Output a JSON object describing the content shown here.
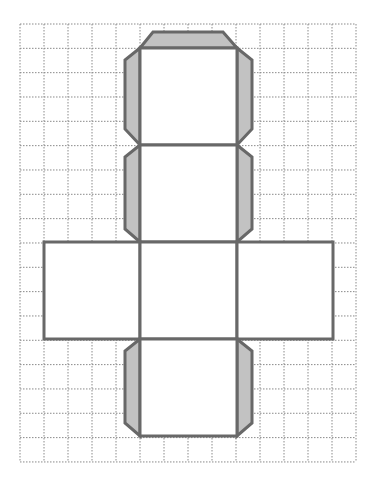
{
  "diagram": {
    "type": "cube-net-with-glue-tabs",
    "grid": {
      "origin_x": 20,
      "origin_y": 24,
      "cols": 14,
      "rows": 18,
      "cell_w": 24,
      "cell_h": 24.33,
      "line_color": "#8a8a8a",
      "line_style": "dotted"
    },
    "colors": {
      "outline": "#686868",
      "flap_fill": "#c2c2c2",
      "face_fill": "#ffffff"
    },
    "faces": [
      {
        "name": "top-face",
        "x": 140,
        "y": 48,
        "w": 97,
        "h": 97
      },
      {
        "name": "upper-face",
        "x": 140,
        "y": 145,
        "w": 97,
        "h": 97
      },
      {
        "name": "left-face",
        "x": 44,
        "y": 242,
        "w": 96,
        "h": 97
      },
      {
        "name": "center-face",
        "x": 140,
        "y": 242,
        "w": 97,
        "h": 97
      },
      {
        "name": "right-face",
        "x": 237,
        "y": 242,
        "w": 96,
        "h": 97
      },
      {
        "name": "bottom-face",
        "x": 140,
        "y": 339,
        "w": 97,
        "h": 97
      }
    ],
    "flaps": [
      {
        "name": "top-flap",
        "points": "140,48 153,32 223,32 237,48"
      },
      {
        "name": "top-left-flap",
        "points": "140,48 125,60 125,129 140,145"
      },
      {
        "name": "top-right-flap",
        "points": "237,48 252,60 252,129 237,145"
      },
      {
        "name": "upper-left-flap",
        "points": "140,145 125,157 125,229 140,242"
      },
      {
        "name": "upper-right-flap",
        "points": "237,145 252,157 252,229 237,242"
      },
      {
        "name": "bottom-left-flap",
        "points": "140,339 125,351 125,423 140,436"
      },
      {
        "name": "bottom-right-flap",
        "points": "237,339 252,351 252,423 237,436"
      }
    ]
  }
}
